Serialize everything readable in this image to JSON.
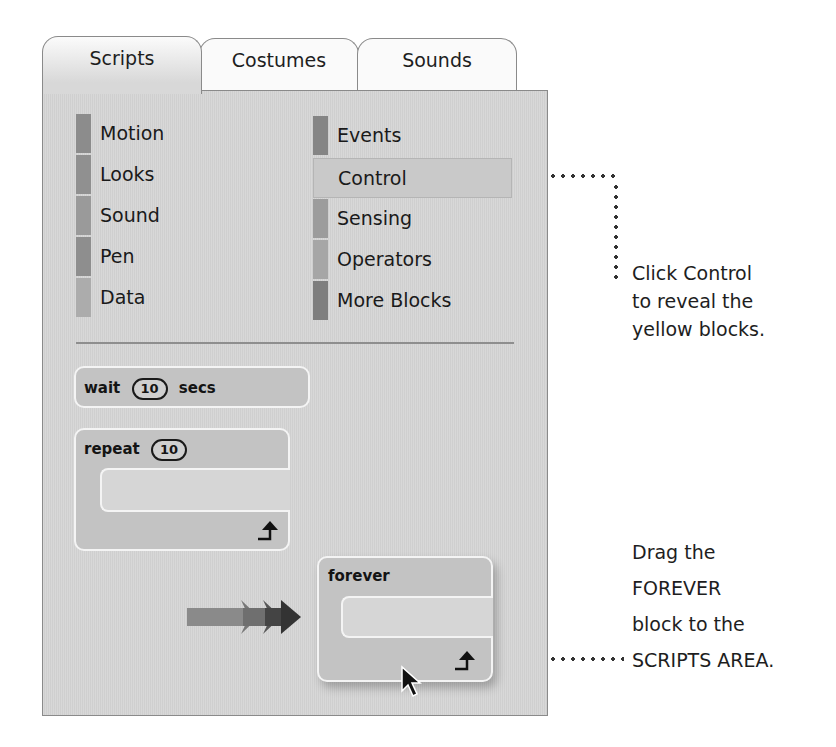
{
  "tabs": [
    {
      "label": "Scripts",
      "active": true
    },
    {
      "label": "Costumes",
      "active": false
    },
    {
      "label": "Sounds",
      "active": false
    }
  ],
  "categories_left": [
    {
      "label": "Motion",
      "color": "#8c8c8c"
    },
    {
      "label": "Looks",
      "color": "#909090"
    },
    {
      "label": "Sound",
      "color": "#9a9a9a"
    },
    {
      "label": "Pen",
      "color": "#8e8e8e"
    },
    {
      "label": "Data",
      "color": "#acacac"
    }
  ],
  "categories_right": [
    {
      "label": "Events",
      "color": "#858585"
    },
    {
      "label": "Control",
      "color": "#c9c9c9",
      "selected": true
    },
    {
      "label": "Sensing",
      "color": "#9c9c9c"
    },
    {
      "label": "Operators",
      "color": "#a6a6a6"
    },
    {
      "label": "More Blocks",
      "color": "#7e7e7e"
    }
  ],
  "blocks": {
    "wait": {
      "prefix": "wait",
      "value": "10",
      "suffix": "secs"
    },
    "repeat": {
      "prefix": "repeat",
      "value": "10"
    },
    "forever": {
      "label": "forever"
    }
  },
  "annotations": {
    "control_note": [
      "Click Control",
      "to reveal the",
      "yellow blocks."
    ],
    "forever_note": [
      "Drag the",
      "FOREVER",
      "block to the",
      "SCRIPTS AREA."
    ]
  }
}
